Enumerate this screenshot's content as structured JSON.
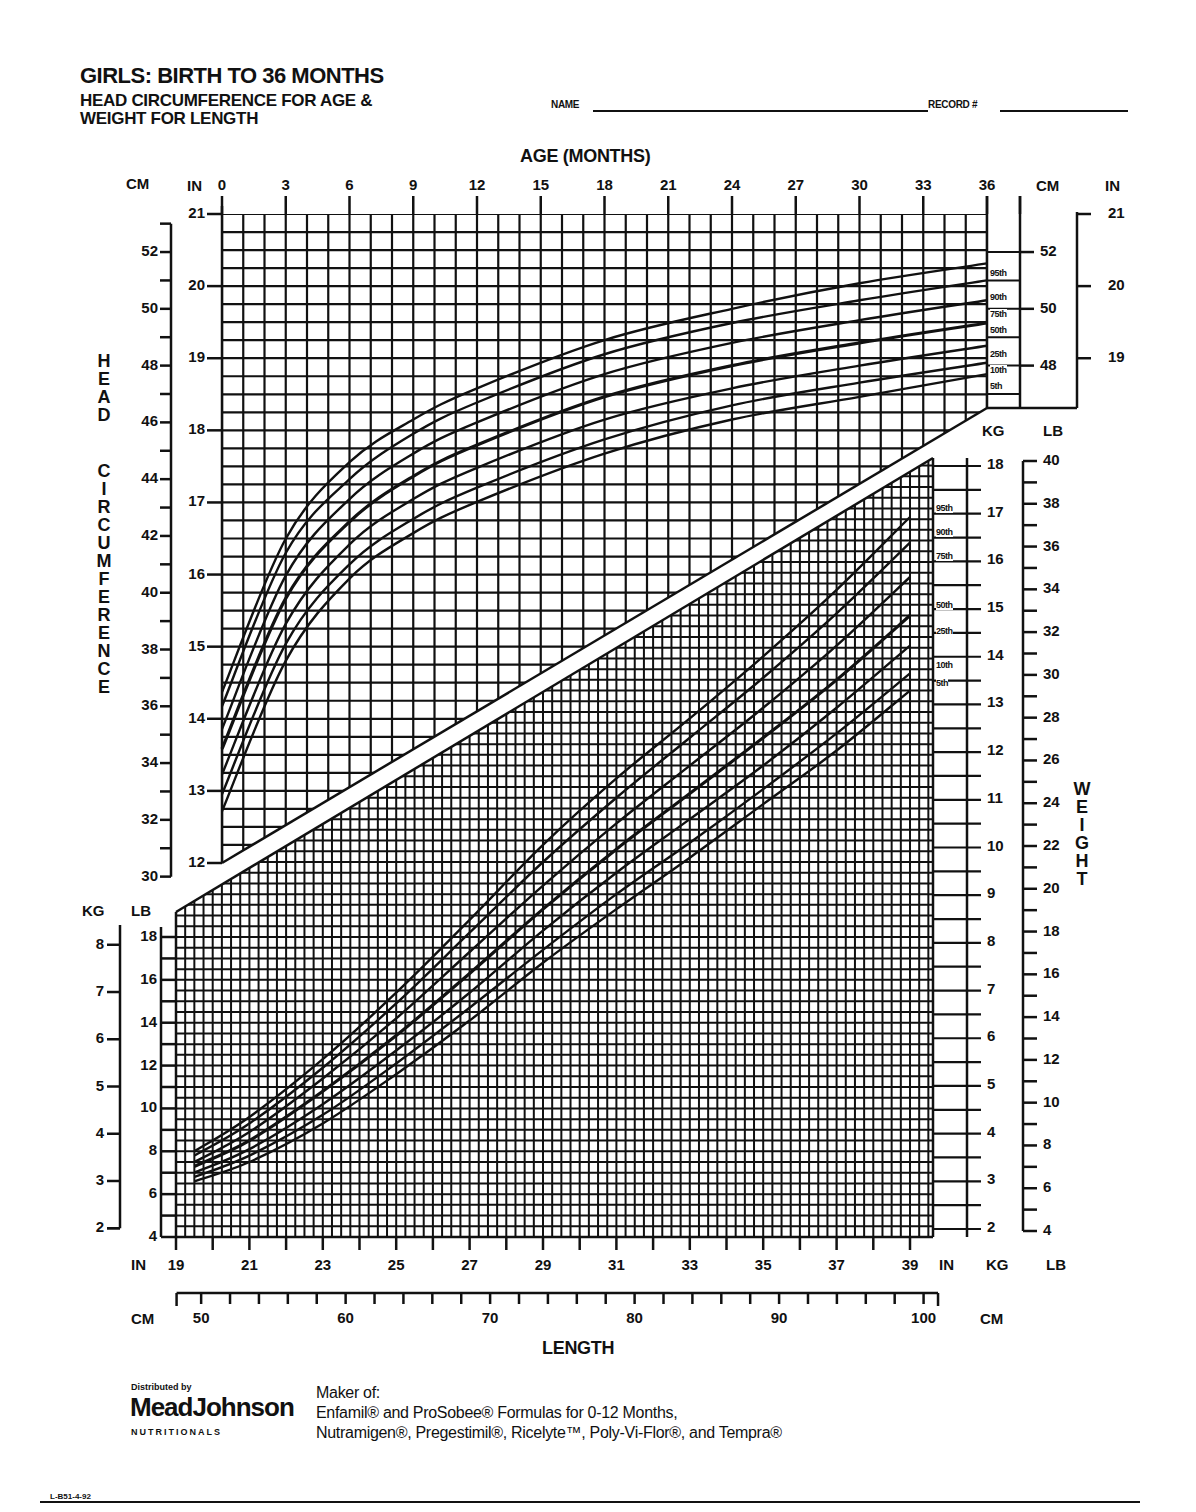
{
  "header": {
    "title": "GIRLS: BIRTH TO 36 MONTHS",
    "subtitle_line1": "HEAD CIRCUMFERENCE FOR AGE &",
    "subtitle_line2": "WEIGHT FOR LENGTH",
    "name_label": "NAME",
    "record_label": "RECORD #"
  },
  "axes": {
    "age_title": "AGE (MONTHS)",
    "length_title": "LENGTH",
    "head_vertical_title": "HEAD CIRCUMFERENCE",
    "weight_vertical_title": "WEIGHT",
    "units": {
      "cm": "CM",
      "in": "IN",
      "kg": "KG",
      "lb": "LB"
    },
    "age_ticks": [
      "0",
      "3",
      "6",
      "9",
      "12",
      "15",
      "18",
      "21",
      "24",
      "27",
      "30",
      "33",
      "36"
    ],
    "head_in_ticks": [
      "21",
      "20",
      "19",
      "18",
      "17",
      "16",
      "15",
      "14",
      "13",
      "12"
    ],
    "head_cm_ticks": [
      "52",
      "50",
      "48",
      "46",
      "44",
      "42",
      "40",
      "38",
      "36",
      "34",
      "32",
      "30"
    ],
    "head_right_cm_ticks": [
      "52",
      "50",
      "48"
    ],
    "head_right_in_ticks": [
      "21",
      "20",
      "19"
    ],
    "weight_left_kg_ticks": [
      "8",
      "7",
      "6",
      "5",
      "4",
      "3",
      "2"
    ],
    "weight_left_lb_ticks": [
      "18",
      "16",
      "14",
      "12",
      "10",
      "8",
      "6",
      "4"
    ],
    "weight_right_kg_ticks": [
      "18",
      "17",
      "16",
      "15",
      "14",
      "13",
      "12",
      "11",
      "10",
      "9",
      "8",
      "7",
      "6",
      "5",
      "4",
      "3",
      "2"
    ],
    "weight_right_lb_ticks": [
      "40",
      "38",
      "36",
      "34",
      "32",
      "30",
      "28",
      "26",
      "24",
      "22",
      "20",
      "18",
      "16",
      "14",
      "12",
      "10",
      "8",
      "6",
      "4"
    ],
    "length_in_ticks": [
      "19",
      "21",
      "23",
      "25",
      "27",
      "29",
      "31",
      "33",
      "35",
      "37",
      "39"
    ],
    "length_cm_ticks": [
      "50",
      "60",
      "70",
      "80",
      "90",
      "100"
    ]
  },
  "percentile_labels": [
    "95th",
    "90th",
    "75th",
    "50th",
    "25th",
    "10th",
    "5th"
  ],
  "footer": {
    "distributed_by": "Distributed by",
    "brand": "MeadJohnson",
    "brand_sub": "NUTRITIONALS",
    "maker_of": "Maker of:",
    "line1": "Enfamil® and ProSobee®  Formulas for 0-12 Months,",
    "line2": "Nutramigen®, Pregestimil®, Ricelyte™, Poly-Vi-Flor®, and Tempra®",
    "code": "L-B51-4-92"
  },
  "colors": {
    "ink": "#111111",
    "paper": "#ffffff"
  },
  "chart_data": [
    {
      "type": "line",
      "title": "Head Circumference for Age (Girls, Birth to 36 Months)",
      "xlabel": "AGE (MONTHS)",
      "ylabel": "HEAD CIRCUMFERENCE (CM / IN)",
      "xlim": [
        0,
        36
      ],
      "ylim_cm": [
        30,
        53
      ],
      "ylim_in": [
        12,
        21
      ],
      "grid": true,
      "legend_position": "right-end labels",
      "x": [
        0,
        3,
        6,
        9,
        12,
        18,
        24,
        30,
        36
      ],
      "series": [
        {
          "name": "95th",
          "values": [
            36.5,
            41.9,
            44.6,
            46.1,
            47.2,
            48.9,
            50.0,
            50.9,
            51.6
          ]
        },
        {
          "name": "90th",
          "values": [
            36.0,
            41.4,
            44.0,
            45.6,
            46.7,
            48.4,
            49.5,
            50.3,
            51.0
          ]
        },
        {
          "name": "75th",
          "values": [
            35.2,
            40.6,
            43.3,
            44.9,
            46.0,
            47.7,
            48.8,
            49.6,
            50.3
          ]
        },
        {
          "name": "50th",
          "values": [
            34.5,
            39.8,
            42.5,
            44.1,
            45.2,
            46.9,
            48.0,
            48.8,
            49.5
          ]
        },
        {
          "name": "25th",
          "values": [
            33.6,
            38.9,
            41.7,
            43.3,
            44.4,
            46.1,
            47.2,
            48.0,
            48.7
          ]
        },
        {
          "name": "10th",
          "values": [
            32.9,
            38.2,
            41.0,
            42.6,
            43.7,
            45.4,
            46.6,
            47.4,
            48.1
          ]
        },
        {
          "name": "5th",
          "values": [
            32.3,
            37.6,
            40.5,
            42.1,
            43.2,
            44.9,
            46.1,
            46.9,
            47.7
          ]
        }
      ]
    },
    {
      "type": "line",
      "title": "Weight for Length (Girls, Birth to 36 Months)",
      "xlabel": "LENGTH (IN / CM)",
      "ylabel": "WEIGHT (KG / LB)",
      "xlim_in": [
        19,
        39.5
      ],
      "xlim_cm": [
        48,
        101
      ],
      "ylim_kg": [
        2,
        18
      ],
      "ylim_lb": [
        4,
        40
      ],
      "grid": true,
      "legend_position": "right-end labels",
      "x_in": [
        19.5,
        21,
        23,
        25,
        27,
        29,
        31,
        33,
        35,
        37,
        39
      ],
      "series": [
        {
          "name": "95th",
          "values_lb": [
            8.0,
            9.6,
            12.3,
            15.4,
            18.8,
            22.3,
            25.4,
            28.2,
            31.1,
            34.2,
            37.6
          ]
        },
        {
          "name": "90th",
          "values_lb": [
            7.8,
            9.3,
            11.9,
            14.9,
            18.2,
            21.5,
            24.5,
            27.3,
            30.1,
            33.1,
            36.4
          ]
        },
        {
          "name": "75th",
          "values_lb": [
            7.5,
            8.9,
            11.4,
            14.2,
            17.3,
            20.4,
            23.3,
            26.0,
            28.7,
            31.6,
            34.8
          ]
        },
        {
          "name": "50th",
          "values_lb": [
            7.3,
            8.5,
            10.8,
            13.4,
            16.3,
            19.3,
            22.1,
            24.7,
            27.3,
            30.0,
            33.0
          ]
        },
        {
          "name": "25th",
          "values_lb": [
            7.0,
            8.1,
            10.2,
            12.7,
            15.4,
            18.3,
            21.0,
            23.5,
            26.0,
            28.7,
            31.6
          ]
        },
        {
          "name": "10th",
          "values_lb": [
            6.8,
            7.8,
            9.7,
            12.1,
            14.7,
            17.4,
            20.0,
            22.4,
            24.9,
            27.5,
            30.3
          ]
        },
        {
          "name": "5th",
          "values_lb": [
            6.6,
            7.5,
            9.3,
            11.6,
            14.1,
            16.8,
            19.3,
            21.7,
            24.2,
            26.7,
            29.5
          ]
        }
      ]
    }
  ]
}
